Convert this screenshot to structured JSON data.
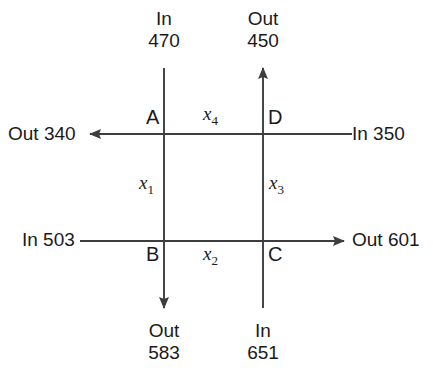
{
  "diagram": {
    "kind": "network-flow-junction-diagram",
    "nodes": [
      {
        "id": "A",
        "label": "A",
        "position": "top-left"
      },
      {
        "id": "D",
        "label": "D",
        "position": "top-right"
      },
      {
        "id": "B",
        "label": "B",
        "position": "bottom-left"
      },
      {
        "id": "C",
        "label": "C",
        "position": "bottom-right"
      }
    ],
    "edge_variables": [
      {
        "id": "x1",
        "symbol": "x",
        "subscript": "1",
        "from": "A",
        "to": "B",
        "orientation": "vertical-left"
      },
      {
        "id": "x2",
        "symbol": "x",
        "subscript": "2",
        "from": "B",
        "to": "C",
        "orientation": "horizontal-bottom"
      },
      {
        "id": "x3",
        "symbol": "x",
        "subscript": "3",
        "from": "C",
        "to": "D",
        "orientation": "vertical-right"
      },
      {
        "id": "x4",
        "symbol": "x",
        "subscript": "4",
        "from": "D",
        "to": "A",
        "orientation": "horizontal-top"
      }
    ],
    "terminals": {
      "top_left": {
        "direction": "In",
        "value": "470",
        "node": "A",
        "arrow": false
      },
      "top_right": {
        "direction": "Out",
        "value": "450",
        "node": "D",
        "arrow": true
      },
      "left_top": {
        "direction": "Out",
        "value": "340",
        "text": "Out 340",
        "node": "A",
        "arrow": true
      },
      "right_top": {
        "direction": "In",
        "value": "350",
        "text": "In 350",
        "node": "D",
        "arrow": false
      },
      "left_bottom": {
        "direction": "In",
        "value": "503",
        "text": "In 503",
        "node": "B",
        "arrow": false
      },
      "right_bottom": {
        "direction": "Out",
        "value": "601",
        "text": "Out 601",
        "node": "C",
        "arrow": true
      },
      "bottom_left": {
        "direction": "Out",
        "value": "583",
        "node": "B",
        "arrow": true
      },
      "bottom_right": {
        "direction": "In",
        "value": "651",
        "node": "C",
        "arrow": false
      }
    },
    "colors": {
      "line": "#3d3d3d",
      "text": "#1a1a1a",
      "background": "#ffffff"
    }
  }
}
